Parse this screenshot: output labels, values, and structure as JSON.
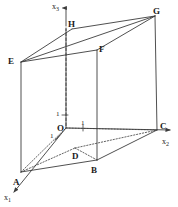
{
  "figure": {
    "kind": "3d-coordinate-box-diagram",
    "background_color": "#ffffff",
    "line_color": "#3c3c3c",
    "label_color": "#1a1a1a",
    "axes": [
      {
        "name": "x3",
        "label": "x",
        "subscript": "3",
        "direction": "up",
        "tick_label": "1"
      },
      {
        "name": "x2",
        "label": "x",
        "subscript": "2",
        "direction": "right",
        "tick_label": "1"
      },
      {
        "name": "x1",
        "label": "x",
        "subscript": "1",
        "direction": "down-left",
        "tick_label": "1"
      }
    ],
    "origin_label": "O",
    "vertices": [
      {
        "name": "A",
        "label": "A",
        "x": 13,
        "y": 178
      },
      {
        "name": "B",
        "label": "B",
        "x": 91,
        "y": 166
      },
      {
        "name": "C",
        "label": "C",
        "x": 160,
        "y": 129
      },
      {
        "name": "D",
        "label": "D",
        "x": 72,
        "y": 152
      },
      {
        "name": "E",
        "label": "E",
        "x": 8,
        "y": 57
      },
      {
        "name": "F",
        "label": "F",
        "x": 96,
        "y": 45
      },
      {
        "name": "G",
        "label": "G",
        "x": 153,
        "y": 8
      },
      {
        "name": "H",
        "label": "H",
        "x": 68,
        "y": 21
      },
      {
        "name": "O",
        "label": "O",
        "x": 58,
        "y": 125
      }
    ],
    "tick_labels": [
      {
        "name": "tick-x3",
        "text": "1",
        "x": 56,
        "y": 112
      },
      {
        "name": "tick-x2",
        "text": "1",
        "x": 79,
        "y": 122
      },
      {
        "name": "tick-x1",
        "text": "1",
        "x": 51,
        "y": 134
      }
    ],
    "axis_labels": [
      {
        "name": "axis-label-x3",
        "base": "x",
        "sub": "3",
        "x": 53,
        "y": 3
      },
      {
        "name": "axis-label-x2",
        "base": "x",
        "sub": "2",
        "x": 163,
        "y": 139
      },
      {
        "name": "axis-label-x1",
        "base": "x",
        "sub": "1",
        "x": 4,
        "y": 196
      }
    ]
  }
}
